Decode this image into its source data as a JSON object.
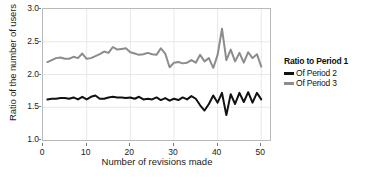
{
  "chart_data": {
    "type": "line",
    "title": "",
    "xlabel": "Number of revisions made",
    "ylabel": "Ratio of the number of users",
    "xlim": [
      0,
      52
    ],
    "ylim": [
      1.0,
      3.0
    ],
    "xticks": [
      0,
      10,
      20,
      30,
      40,
      50
    ],
    "xtick_labels": [
      "0",
      "10",
      "20",
      "30",
      "40",
      "50"
    ],
    "yticks": [
      1.0,
      1.5,
      2.0,
      2.5,
      3.0
    ],
    "ytick_labels": [
      "1.0",
      "1.5",
      "2.0",
      "2.5",
      "3.0"
    ],
    "grid": true,
    "grid_color": "#e8e8e8",
    "legend_position": "right",
    "legend_title": "Ratio to Period 1",
    "x": [
      1,
      2,
      3,
      4,
      5,
      6,
      7,
      8,
      9,
      10,
      11,
      12,
      13,
      14,
      15,
      16,
      17,
      18,
      19,
      20,
      21,
      22,
      23,
      24,
      25,
      26,
      27,
      28,
      29,
      30,
      31,
      32,
      33,
      34,
      35,
      36,
      37,
      38,
      39,
      40,
      41,
      42,
      43,
      44,
      45,
      46,
      47,
      48,
      49,
      50
    ],
    "series": [
      {
        "name": "Of Period 2",
        "color": "#111111",
        "linewidth": 2.0,
        "values": [
          1.62,
          1.63,
          1.63,
          1.64,
          1.64,
          1.63,
          1.65,
          1.62,
          1.66,
          1.62,
          1.66,
          1.68,
          1.63,
          1.63,
          1.65,
          1.66,
          1.65,
          1.65,
          1.64,
          1.65,
          1.63,
          1.66,
          1.62,
          1.63,
          1.62,
          1.65,
          1.61,
          1.64,
          1.6,
          1.63,
          1.61,
          1.65,
          1.62,
          1.67,
          1.63,
          1.53,
          1.45,
          1.55,
          1.68,
          1.57,
          1.72,
          1.38,
          1.7,
          1.55,
          1.72,
          1.58,
          1.73,
          1.57,
          1.72,
          1.62
        ]
      },
      {
        "name": "Of Period 3",
        "color": "#8c8c8c",
        "linewidth": 2.0,
        "values": [
          2.19,
          2.22,
          2.25,
          2.26,
          2.24,
          2.24,
          2.27,
          2.25,
          2.32,
          2.24,
          2.25,
          2.28,
          2.31,
          2.35,
          2.33,
          2.42,
          2.38,
          2.39,
          2.4,
          2.34,
          2.32,
          2.3,
          2.31,
          2.33,
          2.31,
          2.3,
          2.4,
          2.32,
          2.11,
          2.18,
          2.19,
          2.17,
          2.18,
          2.22,
          2.18,
          2.3,
          2.2,
          2.25,
          2.1,
          2.3,
          2.7,
          2.22,
          2.38,
          2.2,
          2.33,
          2.18,
          2.34,
          2.25,
          2.31,
          2.12
        ]
      }
    ]
  },
  "legend": {
    "title": "Ratio to Period 1",
    "entries": [
      {
        "label": "Of Period 2",
        "color": "#111111"
      },
      {
        "label": "Of Period 3",
        "color": "#8c8c8c"
      }
    ]
  }
}
